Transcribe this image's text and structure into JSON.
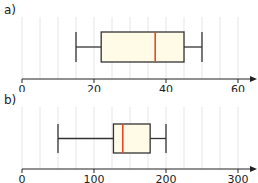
{
  "chart_data": [
    {
      "type": "boxplot",
      "label": "a)",
      "xlim": [
        0,
        60
      ],
      "ticks": [
        0,
        20,
        40,
        60
      ],
      "tick_labels": [
        "0",
        "20",
        "40",
        "60"
      ],
      "grid_step": 5,
      "grid": true,
      "min": 15,
      "q1": 22,
      "median": 37,
      "q3": 45,
      "max": 50,
      "box_fill": "#fffbe6",
      "median_color": "#e8462a"
    },
    {
      "type": "boxplot",
      "label": "b)",
      "xlim": [
        0,
        300
      ],
      "ticks": [
        0,
        100,
        200,
        300
      ],
      "tick_labels": [
        "0",
        "100",
        "200",
        "300"
      ],
      "grid_step": 25,
      "grid": true,
      "min": 50,
      "q1": 127,
      "median": 140,
      "q3": 178,
      "max": 200,
      "box_fill": "#fffbe6",
      "median_color": "#e8462a"
    }
  ]
}
